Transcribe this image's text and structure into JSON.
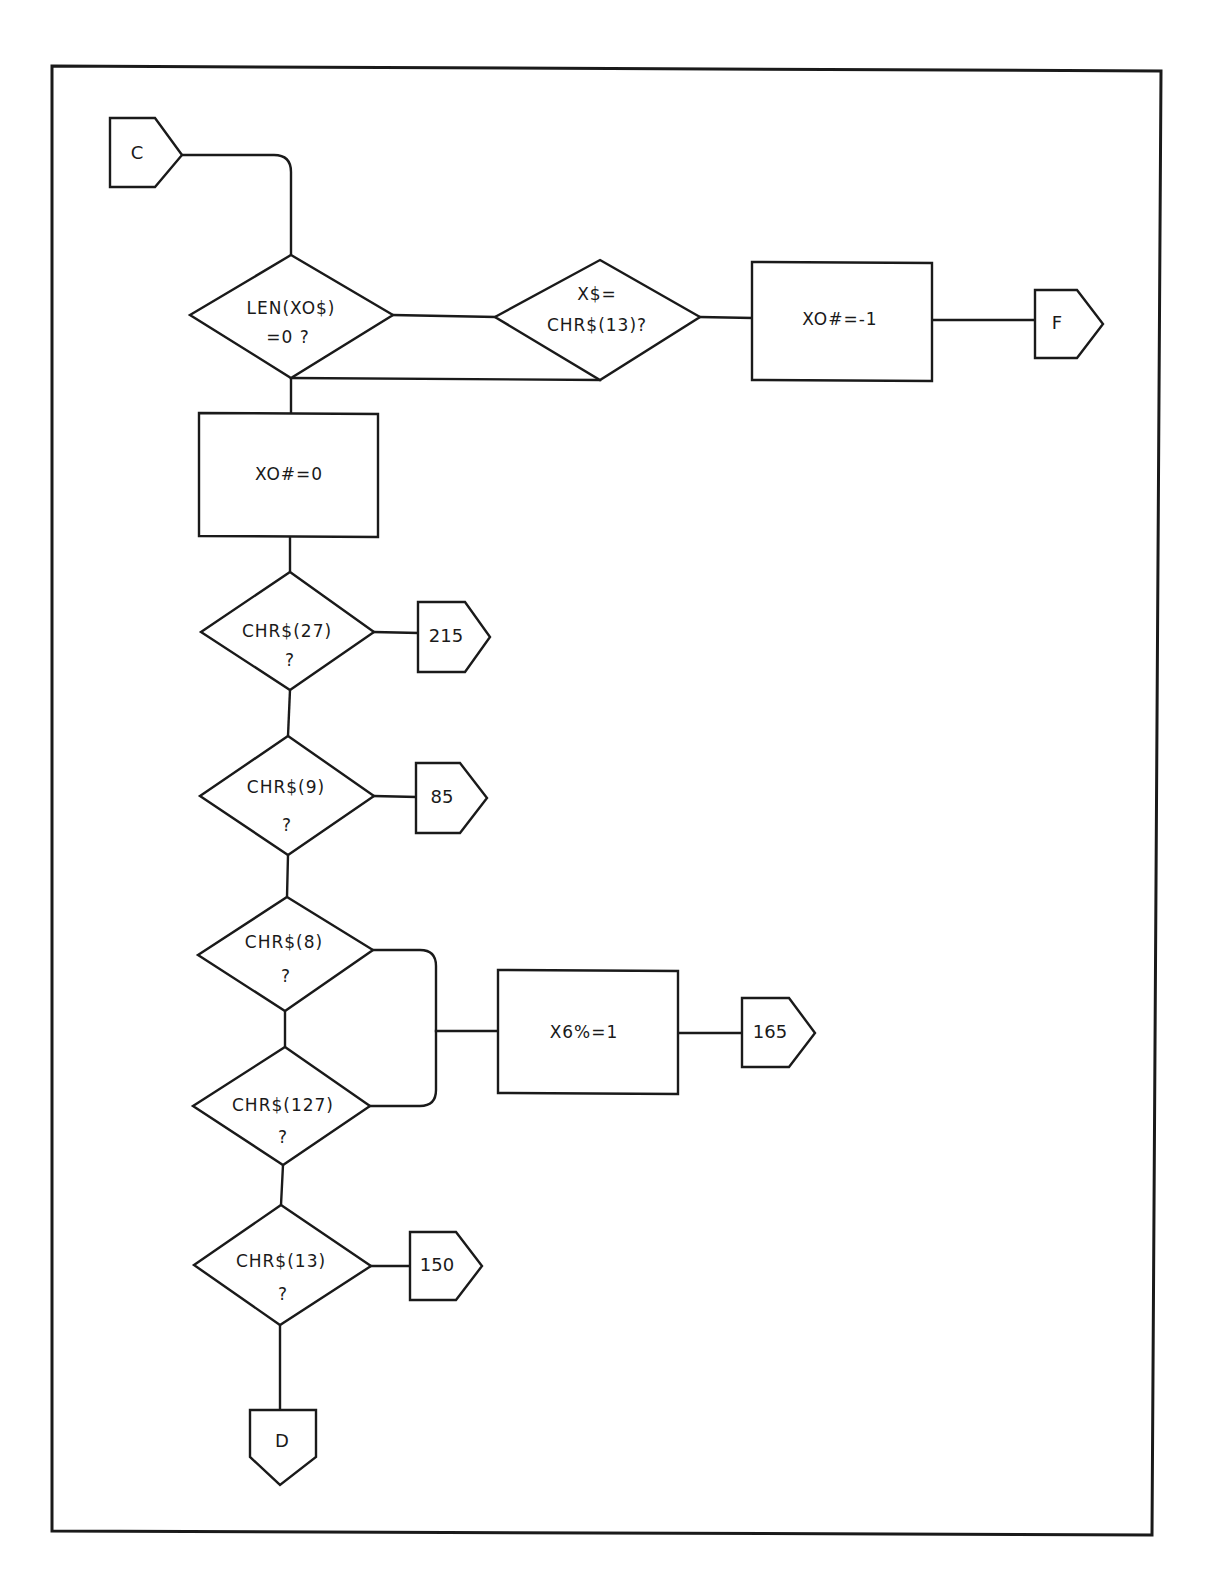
{
  "diagram": {
    "type": "flowchart",
    "connectors": {
      "entry_c": "C",
      "exit_f": "F",
      "goto_215": "215",
      "goto_85": "85",
      "goto_165": "165",
      "goto_150": "150",
      "exit_d": "D"
    },
    "decisions": {
      "len_x0": {
        "line1": "LEN(XO$)",
        "line2": "=0  ?"
      },
      "x_eq_cr": {
        "line1": "X$=",
        "line2": "CHR$(13)?"
      },
      "chr27": {
        "line1": "CHR$(27)",
        "line2": "?"
      },
      "chr9": {
        "line1": "CHR$(9)",
        "line2": "?"
      },
      "chr8": {
        "line1": "CHR$(8)",
        "line2": "?"
      },
      "chr127": {
        "line1": "CHR$(127)",
        "line2": "?"
      },
      "chr13": {
        "line1": "CHR$(13)",
        "line2": "?"
      }
    },
    "processes": {
      "set_x0_neg1": "XO#=-1",
      "set_x0_zero": "XO#=0",
      "set_x6_one": "X6%=1"
    },
    "colors": {
      "ink": "#1a1a1a",
      "paper": "#ffffff"
    }
  }
}
